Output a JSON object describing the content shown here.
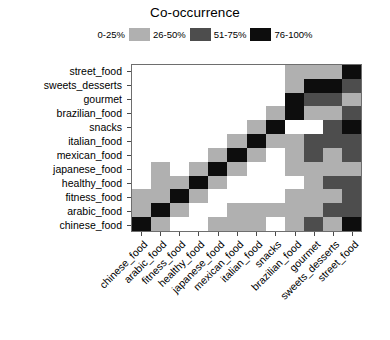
{
  "legend": {
    "title": "Co-occurrence",
    "entries": [
      {
        "label": "0-25%",
        "color": "#ffffff"
      },
      {
        "label": "26-50%",
        "color": "#b0b0b0"
      },
      {
        "label": "51-75%",
        "color": "#4d4d4d"
      },
      {
        "label": "76-100%",
        "color": "#0d0d0d"
      }
    ]
  },
  "chart_data": {
    "type": "heatmap",
    "title": "Co-occurrence",
    "xlabel": "",
    "ylabel": "",
    "grid": false,
    "legend_position": "top",
    "colorscale": [
      {
        "bin": "0-25%",
        "color": "#ffffff",
        "level": 0
      },
      {
        "bin": "26-50%",
        "color": "#b0b0b0",
        "level": 1
      },
      {
        "bin": "51-75%",
        "color": "#4d4d4d",
        "level": 2
      },
      {
        "bin": "76-100%",
        "color": "#0d0d0d",
        "level": 3
      }
    ],
    "x": [
      "chinese_food",
      "arabic_food",
      "fitness_food",
      "healthy_food",
      "japanese_food",
      "mexican_food",
      "italian_food",
      "snacks",
      "brazilian_food",
      "gourmet",
      "sweets_desserts",
      "street_food"
    ],
    "y": [
      "street_food",
      "sweets_desserts",
      "gourmet",
      "brazilian_food",
      "snacks",
      "italian_food",
      "mexican_food",
      "japanese_food",
      "healthy_food",
      "fitness_food",
      "arabic_food",
      "chinese_food"
    ],
    "values": [
      [
        0,
        0,
        0,
        0,
        0,
        0,
        0,
        0,
        1,
        1,
        1,
        3
      ],
      [
        0,
        0,
        0,
        0,
        0,
        0,
        0,
        0,
        1,
        3,
        3,
        2
      ],
      [
        0,
        0,
        0,
        0,
        0,
        0,
        0,
        0,
        3,
        2,
        2,
        1
      ],
      [
        0,
        0,
        0,
        0,
        0,
        0,
        0,
        1,
        3,
        1,
        1,
        2
      ],
      [
        0,
        0,
        0,
        0,
        0,
        0,
        1,
        3,
        0,
        0,
        2,
        3
      ],
      [
        0,
        0,
        0,
        0,
        0,
        1,
        3,
        1,
        1,
        2,
        2,
        2
      ],
      [
        0,
        0,
        0,
        0,
        1,
        3,
        1,
        0,
        1,
        2,
        1,
        2
      ],
      [
        0,
        1,
        0,
        1,
        3,
        1,
        0,
        0,
        1,
        1,
        1,
        1
      ],
      [
        0,
        1,
        1,
        3,
        1,
        0,
        0,
        0,
        0,
        1,
        2,
        2
      ],
      [
        1,
        1,
        3,
        1,
        0,
        0,
        0,
        0,
        1,
        1,
        1,
        2
      ],
      [
        1,
        3,
        1,
        0,
        0,
        1,
        1,
        1,
        1,
        1,
        2,
        2
      ],
      [
        3,
        1,
        0,
        0,
        1,
        1,
        1,
        0,
        1,
        2,
        1,
        3
      ]
    ]
  }
}
